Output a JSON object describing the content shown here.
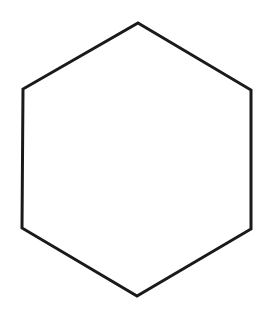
{
  "figure": {
    "shape": "hexagon",
    "stroke_color": "#1a1a1a",
    "fill_color": "#ffffff",
    "stroke_width": 3,
    "vertices": [
      [
        138,
        23
      ],
      [
        251,
        90
      ],
      [
        251,
        229
      ],
      [
        137,
        296
      ],
      [
        22,
        228
      ],
      [
        23,
        89
      ]
    ]
  }
}
